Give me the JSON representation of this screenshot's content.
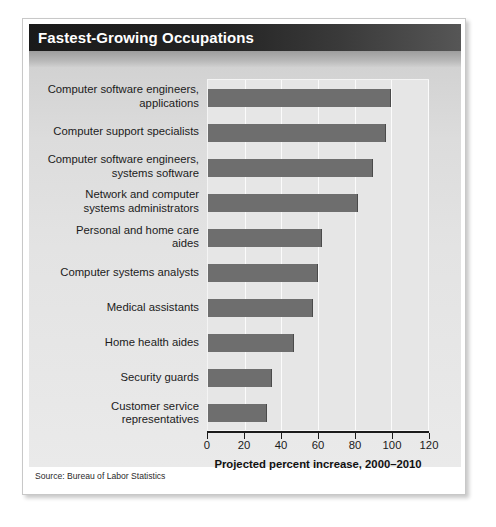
{
  "figure": {
    "title": "Fastest-Growing Occupations",
    "source_note": "Source: Bureau of Labor Statistics"
  },
  "colors": {
    "bar": "#6e6e6e",
    "plot_background": "#e6e6e6",
    "gridline": "#fbfbfb",
    "title_bar_dark": "#1a1a1a",
    "axis": "#1b1b1b"
  },
  "chart_data": {
    "type": "bar",
    "orientation": "horizontal",
    "title": "Fastest-Growing Occupations",
    "xlabel": "Projected percent increase, 2000–2010",
    "ylabel": "",
    "xlim": [
      0,
      120
    ],
    "xticks": [
      0,
      20,
      40,
      60,
      80,
      100,
      120
    ],
    "grid": true,
    "legend": "none",
    "categories": [
      "Computer software engineers, applications",
      "Computer support specialists",
      "Computer software engineers, systems software",
      "Network and computer systems administrators",
      "Personal and home care aides",
      "Computer systems analysts",
      "Medical assistants",
      "Home health aides",
      "Security guards",
      "Customer service representatives"
    ],
    "category_lines": [
      [
        "Computer software engineers,",
        "applications"
      ],
      [
        "Computer support specialists"
      ],
      [
        "Computer software engineers,",
        "systems software"
      ],
      [
        "Network and computer",
        "systems administrators"
      ],
      [
        "Personal and home care",
        "aides"
      ],
      [
        "Computer systems analysts"
      ],
      [
        "Medical assistants"
      ],
      [
        "Home health aides"
      ],
      [
        "Security guards"
      ],
      [
        "Customer service",
        "representatives"
      ]
    ],
    "values": [
      100,
      97,
      90,
      82,
      62,
      60,
      57,
      47,
      35,
      32
    ],
    "units": "percent"
  }
}
